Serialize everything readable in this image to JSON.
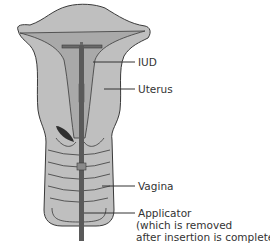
{
  "diagram": {
    "type": "anatomical illustration",
    "colors": {
      "background": "#ffffff",
      "tissue_fill": "#bfbfbf",
      "tissue_inner": "#a9a9a9",
      "outline": "#3a3a3a",
      "applicator": "#5a5a5a",
      "leader_line": "#333333",
      "text": "#333333"
    },
    "labels": [
      {
        "id": "iud",
        "text": "IUD"
      },
      {
        "id": "uterus",
        "text": "Uterus"
      },
      {
        "id": "vagina",
        "text": "Vagina"
      },
      {
        "id": "applicator",
        "lines": [
          "Applicator",
          "(which is removed",
          "after insertion is completed)"
        ]
      }
    ]
  }
}
